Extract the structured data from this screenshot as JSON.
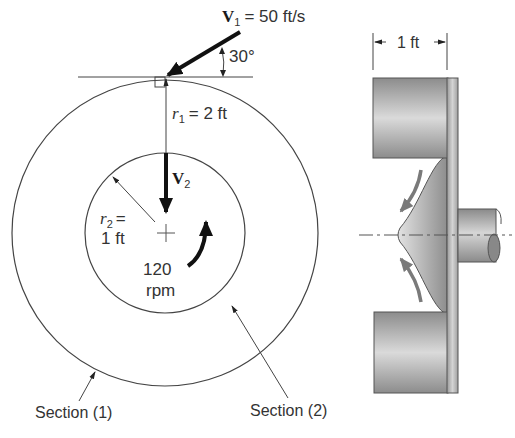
{
  "figure": {
    "type": "engineering-diagram",
    "front_view": {
      "v1": {
        "symbol": "V",
        "subscript": "1",
        "value_text": "= 50 ft/s"
      },
      "angle": {
        "text": "30°"
      },
      "r1": {
        "symbol": "r",
        "subscript": "1",
        "value_text": "= 2 ft"
      },
      "v2": {
        "symbol": "V",
        "subscript": "2"
      },
      "r2": {
        "symbol": "r",
        "subscript": "2",
        "eq": "=",
        "value_text": "1 ft"
      },
      "speed": {
        "value": "120",
        "unit": "rpm"
      },
      "section1_label": "Section (1)",
      "section2_label": "Section (2)"
    },
    "side_view": {
      "width_label": "1 ft"
    },
    "colors": {
      "line": "#444444",
      "arrow": "#111111",
      "flow_arrow": "#7a7a7a",
      "metal_dark": "#8a8a8a",
      "metal_light": "#d8d8d8"
    }
  }
}
